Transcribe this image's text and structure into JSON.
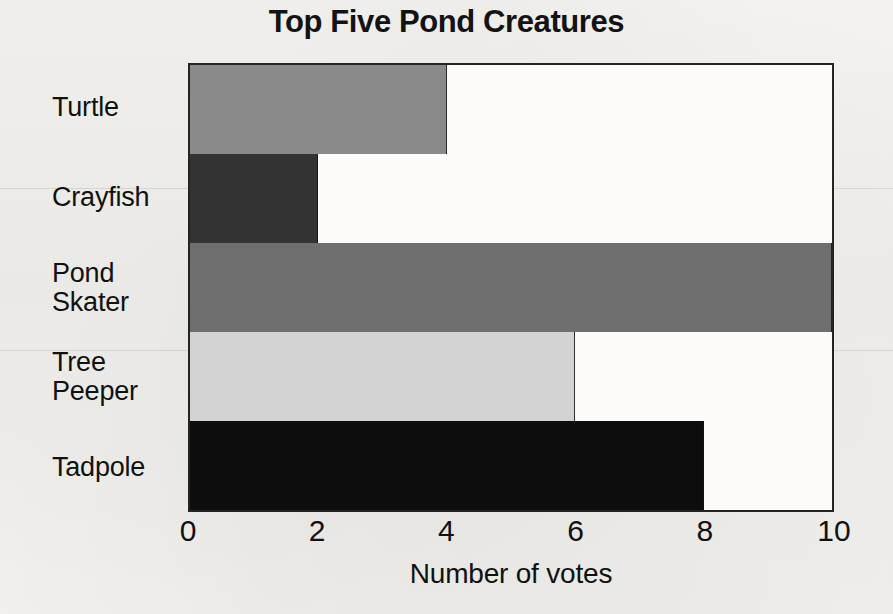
{
  "chart_data": {
    "type": "bar",
    "orientation": "horizontal",
    "title": "Top Five Pond Creatures",
    "xlabel": "Number of votes",
    "ylabel": "",
    "categories": [
      "Turtle",
      "Crayfish",
      "Pond Skater",
      "Tree Peeper",
      "Tadpole"
    ],
    "values": [
      4,
      2,
      10,
      6,
      8
    ],
    "xlim": [
      0,
      10
    ],
    "xticks": [
      0,
      2,
      4,
      6,
      8,
      10
    ],
    "xtick_labels": [
      "0",
      "2",
      "4",
      "6",
      "8",
      "10"
    ],
    "grid": false,
    "legend": null,
    "bars": [
      {
        "category": "Turtle",
        "label_lines": [
          "Turtle"
        ],
        "value": 4,
        "color": "#8a8a8a"
      },
      {
        "category": "Crayfish",
        "label_lines": [
          "Crayfish"
        ],
        "value": 2,
        "color": "#333333"
      },
      {
        "category": "Pond Skater",
        "label_lines": [
          "Pond",
          "Skater"
        ],
        "value": 10,
        "color": "#6e6e6e"
      },
      {
        "category": "Tree Peeper",
        "label_lines": [
          "Tree",
          "Peeper"
        ],
        "value": 6,
        "color": "#d2d2d2"
      },
      {
        "category": "Tadpole",
        "label_lines": [
          "Tadpole"
        ],
        "value": 8,
        "color": "#0d0d0d"
      }
    ]
  },
  "colors": {
    "page_background": "#f2f1ee",
    "plot_background": "#fcfbf9",
    "axis_line": "#242424",
    "text": "#131313"
  }
}
